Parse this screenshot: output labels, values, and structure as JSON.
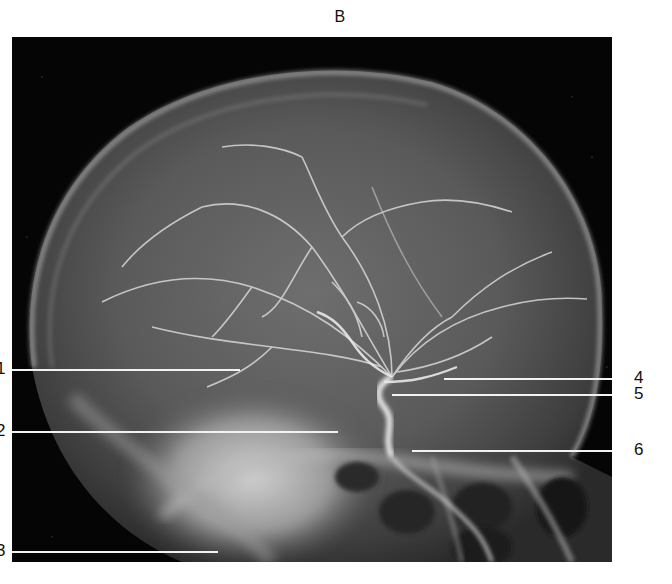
{
  "figure": {
    "panel_letter": "B",
    "labels": [
      {
        "id": "1",
        "text": "1",
        "side": "left"
      },
      {
        "id": "2",
        "text": "2",
        "side": "left"
      },
      {
        "id": "3",
        "text": "3",
        "side": "left"
      },
      {
        "id": "4",
        "text": "4",
        "side": "right"
      },
      {
        "id": "5",
        "text": "5",
        "side": "right"
      },
      {
        "id": "6",
        "text": "6",
        "side": "right"
      }
    ]
  },
  "colors": {
    "background": "#ffffff",
    "film_background": "#050505",
    "skull_bone": "#8a8a8a",
    "vessels": "#d8d8d8",
    "leader_lines": "#f2f2f2",
    "label_text": "#111111"
  }
}
